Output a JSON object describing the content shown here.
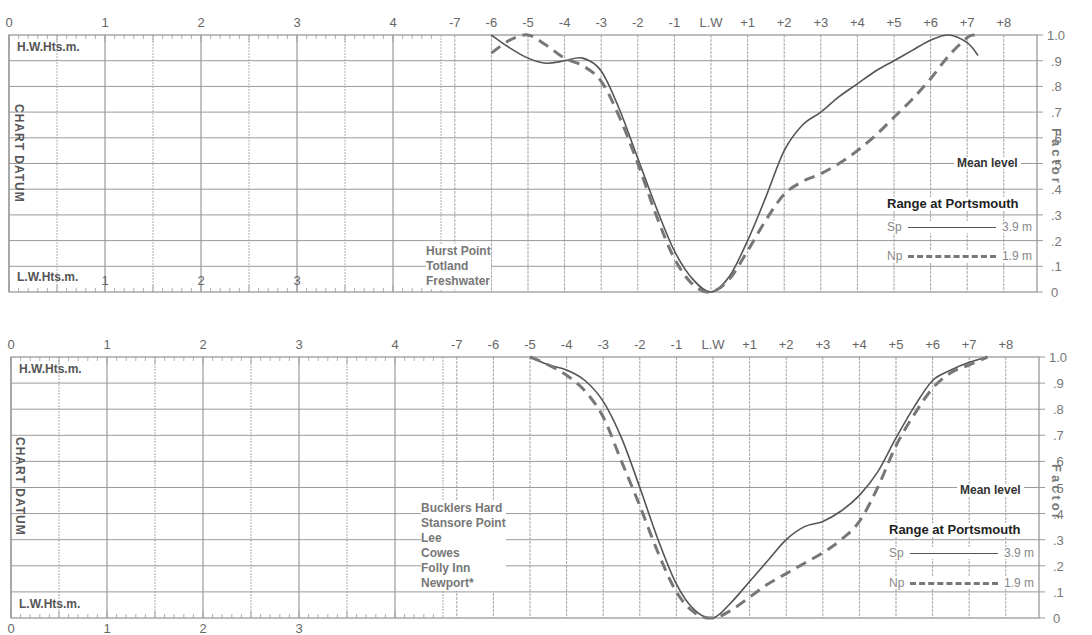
{
  "charts": {
    "top": {
      "height_axis_top_label": "H.W.Hts.m.",
      "height_axis_bottom_label": "L.W.Hts.m.",
      "datum_label": "CHART DATUM",
      "factor_label": "Factor",
      "mean_level_label": "Mean level",
      "legend_title": "Range at Portsmouth",
      "legend_sp_label": "Sp",
      "legend_sp_value": "3.9 m",
      "legend_np_label": "Np",
      "legend_np_value": "1.9 m",
      "ports": [
        "Hurst Point",
        "Totland",
        "Freshwater"
      ]
    },
    "bottom": {
      "height_axis_top_label": "H.W.Hts.m.",
      "height_axis_bottom_label": "L.W.Hts.m.",
      "datum_label": "CHART DATUM",
      "factor_label": "Factor",
      "mean_level_label": "Mean level",
      "legend_title": "Range at Portsmouth",
      "legend_sp_label": "Sp",
      "legend_sp_value": "3.9 m",
      "legend_np_label": "Np",
      "legend_np_value": "1.9 m",
      "ports": [
        "Bucklers Hard",
        "Stansore Point",
        "Lee",
        "Cowes",
        "Folly Inn",
        "Newport*"
      ]
    }
  },
  "axes": {
    "hw_height_ticks": [
      "0",
      "1",
      "2",
      "3",
      "4"
    ],
    "lw_height_ticks_top": [
      "1",
      "2",
      "3"
    ],
    "lw_height_ticks_bottom": [
      "0",
      "1",
      "2",
      "3"
    ],
    "hour_ticks_top": [
      "-7",
      "-6",
      "-5",
      "-4",
      "-3",
      "-2",
      "-1",
      "L.W",
      "+1",
      "+2",
      "+3",
      "+4",
      "+5",
      "+6",
      "+7",
      "+8"
    ],
    "hour_ticks_bottom": [
      "-7",
      "-6",
      "-5",
      "-4",
      "-3",
      "-2",
      "-1",
      "L.W",
      "+1",
      "+2",
      "+3",
      "+4",
      "+5",
      "+6",
      "+7",
      "+8"
    ],
    "factor_ticks": [
      "1.0",
      ".9",
      ".8",
      ".7",
      ".6",
      ".5",
      ".4",
      ".3",
      ".2",
      ".1",
      "0"
    ]
  },
  "colors": {
    "grid": "#9a9a9a",
    "curve": "#555555",
    "text": "#555555"
  },
  "chart_data": [
    {
      "type": "line",
      "title": "Tidal curves: Hurst Point, Totland, Freshwater",
      "xlabel": "Hours relative to Low Water",
      "ylabel": "Factor",
      "ylim": [
        0,
        1.0
      ],
      "x_categories": [
        "-7",
        "-6",
        "-5",
        "-4",
        "-3",
        "-2",
        "-1",
        "L.W",
        "+1",
        "+2",
        "+3",
        "+4",
        "+5",
        "+6",
        "+7",
        "+8"
      ],
      "grid": true,
      "legend_position": "right",
      "series": [
        {
          "name": "Sp (Springs, range 3.9 m)",
          "style": "solid",
          "x": [
            -6,
            -5.5,
            -5,
            -4.5,
            -4,
            -3.5,
            -3,
            -2.5,
            -2,
            -1.5,
            -1,
            -0.5,
            0,
            0.5,
            1,
            1.5,
            2,
            2.5,
            3,
            3.5,
            4,
            4.5,
            5,
            5.5,
            6,
            6.5,
            7,
            7.3
          ],
          "y": [
            1.0,
            0.95,
            0.91,
            0.89,
            0.9,
            0.91,
            0.86,
            0.71,
            0.52,
            0.33,
            0.16,
            0.05,
            0.0,
            0.06,
            0.2,
            0.37,
            0.55,
            0.65,
            0.7,
            0.76,
            0.81,
            0.86,
            0.9,
            0.94,
            0.98,
            1.0,
            0.97,
            0.92
          ]
        },
        {
          "name": "Np (Neaps, range 1.9 m)",
          "style": "dashed",
          "x": [
            -6,
            -5.5,
            -5,
            -4.5,
            -4,
            -3.5,
            -3,
            -2.5,
            -2,
            -1.5,
            -1,
            -0.5,
            0,
            0.5,
            1,
            1.5,
            2,
            2.5,
            3,
            3.5,
            4,
            4.5,
            5,
            5.5,
            6,
            6.5,
            7,
            7.2
          ],
          "y": [
            0.93,
            0.98,
            1.0,
            0.96,
            0.91,
            0.88,
            0.82,
            0.68,
            0.5,
            0.3,
            0.13,
            0.03,
            0.0,
            0.05,
            0.16,
            0.28,
            0.38,
            0.43,
            0.46,
            0.5,
            0.55,
            0.61,
            0.68,
            0.75,
            0.83,
            0.92,
            0.99,
            1.0
          ]
        }
      ]
    },
    {
      "type": "line",
      "title": "Tidal curves: Bucklers Hard, Stansore Point, Lee, Cowes, Folly Inn, Newport*",
      "xlabel": "Hours relative to Low Water",
      "ylabel": "Factor",
      "ylim": [
        0,
        1.0
      ],
      "x_categories": [
        "-7",
        "-6",
        "-5",
        "-4",
        "-3",
        "-2",
        "-1",
        "L.W",
        "+1",
        "+2",
        "+3",
        "+4",
        "+5",
        "+6",
        "+7",
        "+8"
      ],
      "grid": true,
      "legend_position": "right",
      "series": [
        {
          "name": "Sp (Springs, range 3.9 m)",
          "style": "solid",
          "x": [
            -5,
            -4.5,
            -4,
            -3.5,
            -3,
            -2.5,
            -2,
            -1.5,
            -1,
            -0.5,
            0,
            0.5,
            1,
            1.5,
            2,
            2.5,
            3,
            3.5,
            4,
            4.5,
            5,
            5.5,
            6,
            6.5,
            7,
            7.5
          ],
          "y": [
            1.0,
            0.97,
            0.95,
            0.91,
            0.83,
            0.69,
            0.5,
            0.3,
            0.13,
            0.03,
            0.0,
            0.06,
            0.14,
            0.22,
            0.3,
            0.35,
            0.37,
            0.41,
            0.47,
            0.56,
            0.69,
            0.81,
            0.91,
            0.95,
            0.98,
            1.0
          ]
        },
        {
          "name": "Np (Neaps, range 1.9 m)",
          "style": "dashed",
          "x": [
            -5,
            -4.5,
            -4,
            -3.5,
            -3,
            -2.5,
            -2,
            -1.5,
            -1,
            -0.5,
            0,
            0.5,
            1,
            1.5,
            2,
            2.5,
            3,
            3.5,
            4,
            4.5,
            5,
            5.5,
            6,
            6.5,
            7,
            7.5
          ],
          "y": [
            1.0,
            0.97,
            0.93,
            0.87,
            0.77,
            0.6,
            0.43,
            0.25,
            0.1,
            0.02,
            0.0,
            0.03,
            0.08,
            0.13,
            0.17,
            0.21,
            0.25,
            0.3,
            0.37,
            0.5,
            0.66,
            0.78,
            0.88,
            0.94,
            0.97,
            1.0
          ]
        }
      ]
    }
  ]
}
